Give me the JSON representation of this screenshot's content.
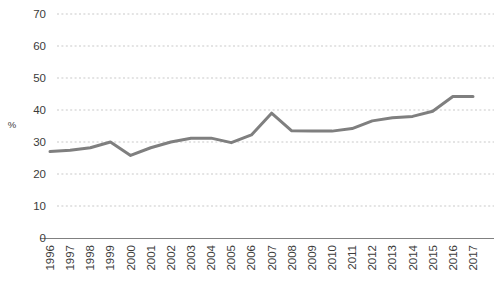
{
  "chart_data": {
    "type": "line",
    "title": "",
    "subtitle": "",
    "xlabel": "",
    "ylabel": "%",
    "x": [
      "1996",
      "1997",
      "1998",
      "1999",
      "2000",
      "2001",
      "2002",
      "2003",
      "2004",
      "2005",
      "2006",
      "2007",
      "2008",
      "2009",
      "2010",
      "2011",
      "2012",
      "2013",
      "2014",
      "2015",
      "2016",
      "2017"
    ],
    "categories": [
      "1996",
      "1997",
      "1998",
      "1999",
      "2000",
      "2001",
      "2002",
      "2003",
      "2004",
      "2005",
      "2006",
      "2007",
      "2008",
      "2009",
      "2010",
      "2011",
      "2012",
      "2013",
      "2014",
      "2015",
      "2016",
      "2017"
    ],
    "values": [
      27.0,
      27.4,
      28.2,
      30.0,
      25.8,
      28.2,
      30.0,
      31.2,
      31.2,
      29.8,
      32.2,
      39.0,
      33.5,
      33.4,
      33.4,
      34.2,
      36.6,
      37.6,
      38.0,
      39.6,
      44.2,
      44.2
    ],
    "series": [
      {
        "name": "",
        "color": "#7f7f7f",
        "values": [
          27.0,
          27.4,
          28.2,
          30.0,
          25.8,
          28.2,
          30.0,
          31.2,
          31.2,
          29.8,
          32.2,
          39.0,
          33.5,
          33.4,
          33.4,
          34.2,
          36.6,
          37.6,
          38.0,
          39.6,
          44.2,
          44.2
        ]
      }
    ],
    "ylim": [
      0,
      70
    ],
    "yticks": [
      0,
      10,
      20,
      30,
      40,
      50,
      60,
      70
    ],
    "ytick_labels": [
      "0",
      "10",
      "20",
      "30",
      "40",
      "50",
      "60",
      "70"
    ],
    "xtick_labels": [
      "1996",
      "1997",
      "1998",
      "1999",
      "2000",
      "2001",
      "2002",
      "2003",
      "2004",
      "2005",
      "2006",
      "2007",
      "2008",
      "2009",
      "2010",
      "2011",
      "2012",
      "2013",
      "2014",
      "2015",
      "2016",
      "2017"
    ],
    "grid": true,
    "grid_style": "dotted-horizontal",
    "grid_color": "#c9c9c9",
    "legend": false,
    "legend_position": "none",
    "line_color": "#7f7f7f",
    "line_width": 3,
    "markers": false,
    "axis_color": "#808080",
    "background": "#ffffff",
    "annotations": []
  },
  "axis": {
    "y_label": "%",
    "y_ticks": [
      "70",
      "60",
      "50",
      "40",
      "30",
      "20",
      "10",
      "0"
    ],
    "x_ticks": [
      "1996",
      "1997",
      "1998",
      "1999",
      "2000",
      "2001",
      "2002",
      "2003",
      "2004",
      "2005",
      "2006",
      "2007",
      "2008",
      "2009",
      "2010",
      "2011",
      "2012",
      "2013",
      "2014",
      "2015",
      "2016",
      "2017"
    ]
  }
}
